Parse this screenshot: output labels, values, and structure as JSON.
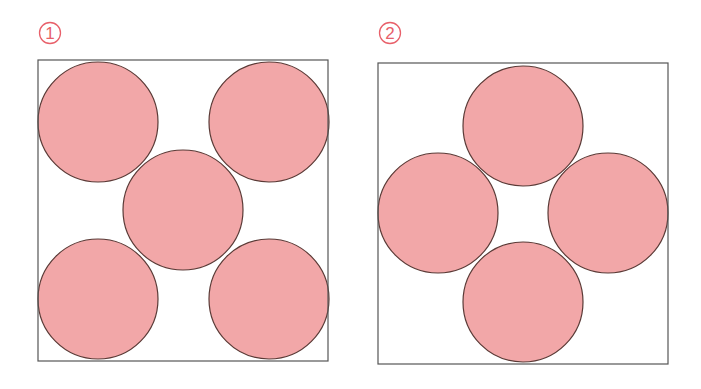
{
  "colors": {
    "circle_fill": "#f2a7a8",
    "circle_stroke": "#5a3a36",
    "box_stroke": "#555555",
    "label_color": "#e8606a",
    "background": "#ffffff"
  },
  "figures": [
    {
      "label": "1",
      "label_center": [
        50,
        33
      ],
      "box": {
        "x": 38,
        "y": 60,
        "width": 290,
        "height": 301
      },
      "circle_radius": 60,
      "circles": [
        {
          "cx": 98,
          "cy": 122
        },
        {
          "cx": 269,
          "cy": 122
        },
        {
          "cx": 183,
          "cy": 210
        },
        {
          "cx": 98,
          "cy": 299
        },
        {
          "cx": 269,
          "cy": 299
        }
      ]
    },
    {
      "label": "2",
      "label_center": [
        390,
        33
      ],
      "box": {
        "x": 378,
        "y": 63,
        "width": 290,
        "height": 301
      },
      "circle_radius": 60,
      "circles": [
        {
          "cx": 523,
          "cy": 126
        },
        {
          "cx": 438,
          "cy": 213
        },
        {
          "cx": 608,
          "cy": 213
        },
        {
          "cx": 523,
          "cy": 302
        }
      ]
    }
  ]
}
